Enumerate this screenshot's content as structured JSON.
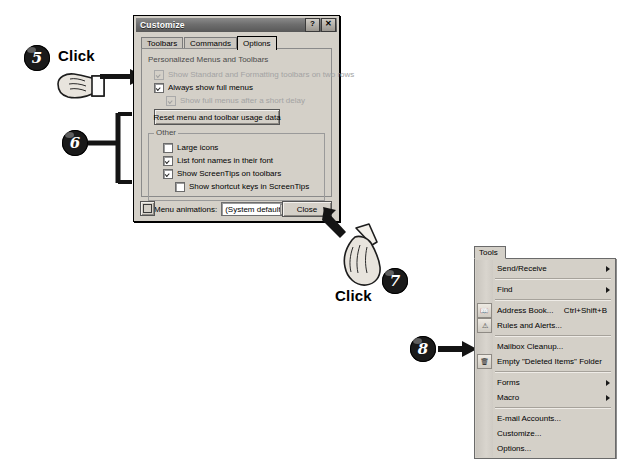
{
  "dialog": {
    "title": "Customize",
    "title_buttons": {
      "help": "?",
      "close": "✕"
    },
    "tabs": [
      {
        "label": "Toolbars",
        "active": false
      },
      {
        "label": "Commands",
        "active": false
      },
      {
        "label": "Options",
        "active": true
      }
    ],
    "sections": {
      "personalized": {
        "label": "Personalized Menus and Toolbars",
        "options": [
          {
            "label": "Show Standard and Formatting toolbars on two rows",
            "checked": true,
            "disabled": true
          },
          {
            "label": "Always show full menus",
            "checked": true,
            "disabled": false
          },
          {
            "label": "Show full menus after a short delay",
            "checked": true,
            "disabled": true
          }
        ],
        "reset_button": "Reset menu and toolbar usage data"
      },
      "other": {
        "label": "Other",
        "options": [
          {
            "label": "Large icons",
            "checked": false,
            "disabled": false
          },
          {
            "label": "List font names in their font",
            "checked": true,
            "disabled": false
          },
          {
            "label": "Show ScreenTips on toolbars",
            "checked": true,
            "disabled": false
          },
          {
            "label": "Show shortcut keys in ScreenTips",
            "checked": false,
            "disabled": false
          }
        ],
        "menu_animations_label": "Menu animations:",
        "menu_animations_value": "(System default)"
      }
    },
    "close_button": "Close",
    "keyboard_button": "keyboard-icon"
  },
  "tools_menu": {
    "button_label": "Tools",
    "items": [
      {
        "label": "Send/Receive",
        "accel": "",
        "submenu": true,
        "icon": ""
      },
      {
        "label": "Find",
        "accel": "",
        "submenu": true,
        "icon": ""
      },
      {
        "separator_after": true
      },
      {
        "label": "Address Book...",
        "accel": "Ctrl+Shift+B",
        "submenu": false,
        "icon": "address-book-icon"
      },
      {
        "label": "Rules and Alerts...",
        "accel": "",
        "submenu": false,
        "icon": "rules-alerts-icon"
      },
      {
        "separator_after": true
      },
      {
        "label": "Mailbox Cleanup...",
        "accel": "",
        "submenu": false,
        "icon": ""
      },
      {
        "label": "Empty \"Deleted Items\" Folder",
        "accel": "",
        "submenu": false,
        "icon": "trash-icon"
      },
      {
        "separator_after": true
      },
      {
        "label": "Forms",
        "accel": "",
        "submenu": true,
        "icon": ""
      },
      {
        "label": "Macro",
        "accel": "",
        "submenu": true,
        "icon": ""
      },
      {
        "separator_after": true
      },
      {
        "label": "E-mail Accounts...",
        "accel": "",
        "submenu": false,
        "icon": ""
      },
      {
        "label": "Customize...",
        "accel": "",
        "submenu": false,
        "icon": ""
      },
      {
        "label": "Options...",
        "accel": "",
        "submenu": false,
        "icon": ""
      }
    ]
  },
  "callouts": [
    {
      "number": "5",
      "action_label": "Click"
    },
    {
      "number": "6",
      "action_label": ""
    },
    {
      "number": "7",
      "action_label": "Click"
    },
    {
      "number": "8",
      "action_label": ""
    }
  ]
}
